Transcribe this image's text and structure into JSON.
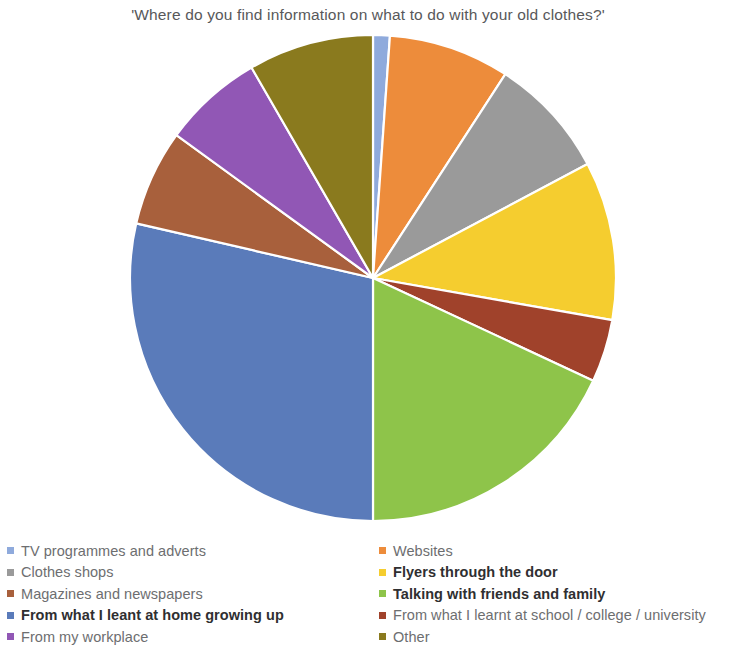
{
  "chart_data": {
    "type": "pie",
    "title": "'Where do you find information on what to do with your old clothes?'",
    "subtitle": "",
    "xlabel": "",
    "ylabel": "",
    "grid": false,
    "legend_position": "bottom",
    "legend_columns": 2,
    "start_angle_deg": 0,
    "direction": "clockwise",
    "categories": [
      "TV programmes and adverts",
      "Websites",
      "Clothes shops",
      "Flyers through the door",
      "Magazines and newspapers",
      "Talking with friends and family",
      "From what I leant at home growing up",
      "From what I learnt at school / college / university",
      "From my workplace",
      "Other"
    ],
    "values": [
      1.1,
      8.1,
      8.1,
      10.6,
      6.4,
      18.1,
      28.6,
      4.2,
      6.7,
      8.3
    ],
    "colors": [
      "#8faadc",
      "#ed8c3b",
      "#9a9a9a",
      "#f5cd2f",
      "#a8603c",
      "#8ec44a",
      "#5a7bba",
      "#a0422b",
      "#9157b5",
      "#8a7a1e"
    ],
    "slices": [
      {
        "label": "TV programmes and adverts",
        "value": 1.1,
        "color": "#8faadc",
        "start_deg": 0,
        "end_deg": 4
      },
      {
        "label": "Websites",
        "value": 8.1,
        "color": "#ed8c3b",
        "start_deg": 4,
        "end_deg": 33
      },
      {
        "label": "Clothes shops",
        "value": 8.1,
        "color": "#9a9a9a",
        "start_deg": 33,
        "end_deg": 62
      },
      {
        "label": "Flyers through the door",
        "value": 10.6,
        "color": "#f5cd2f",
        "start_deg": 62,
        "end_deg": 100
      },
      {
        "label": "From what I learnt at school / college / university",
        "value": 4.2,
        "color": "#a0422b",
        "start_deg": 100,
        "end_deg": 115
      },
      {
        "label": "Talking with friends and family",
        "value": 18.1,
        "color": "#8ec44a",
        "start_deg": 115,
        "end_deg": 180
      },
      {
        "label": "From what I leant at home growing up",
        "value": 28.6,
        "color": "#5a7bba",
        "start_deg": 180,
        "end_deg": 283
      },
      {
        "label": "Magazines and newspapers",
        "value": 6.4,
        "color": "#a8603c",
        "start_deg": 283,
        "end_deg": 306
      },
      {
        "label": "From my workplace",
        "value": 6.7,
        "color": "#9157b5",
        "start_deg": 306,
        "end_deg": 330
      },
      {
        "label": "Other",
        "value": 8.3,
        "color": "#8a7a1e",
        "start_deg": 330,
        "end_deg": 360
      }
    ]
  },
  "title": "'Where do you find information on what to do with your old clothes?'",
  "legend": {
    "left_column": [
      {
        "label": "TV programmes and adverts",
        "color": "#8faadc",
        "bold": false
      },
      {
        "label": "Clothes shops",
        "color": "#9a9a9a",
        "bold": false
      },
      {
        "label": "Magazines and newspapers",
        "color": "#a8603c",
        "bold": false
      },
      {
        "label": "From what I leant at home growing up",
        "color": "#5a7bba",
        "bold": true
      },
      {
        "label": "From my workplace",
        "color": "#9157b5",
        "bold": false
      }
    ],
    "right_column": [
      {
        "label": "Websites",
        "color": "#ed8c3b",
        "bold": false
      },
      {
        "label": "Flyers through the door",
        "color": "#f5cd2f",
        "bold": true
      },
      {
        "label": "Talking with friends and family",
        "color": "#8ec44a",
        "bold": true
      },
      {
        "label": "From what I learnt at school / college / university",
        "color": "#a0422b",
        "bold": false
      },
      {
        "label": "Other",
        "color": "#8a7a1e",
        "bold": false
      }
    ]
  },
  "geometry": {
    "center_x": 373,
    "center_y": 278,
    "radius": 243
  }
}
